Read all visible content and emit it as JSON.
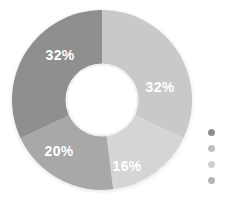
{
  "chart_data": {
    "type": "pie",
    "variant": "donut",
    "title": "",
    "subtitle": "",
    "xlabel": "",
    "ylabel": "",
    "grid": false,
    "legend_position": "right",
    "start_angle_deg": 0,
    "direction": "clockwise",
    "inner_radius_ratio": 0.39,
    "categories": [
      "Segment 1",
      "Segment 2",
      "Segment 3",
      "Segment 4"
    ],
    "values": [
      32,
      16,
      20,
      32
    ],
    "value_unit": "%",
    "data_labels": [
      "32%",
      "16%",
      "20%",
      "32%"
    ],
    "colors": [
      "#c9c9c9",
      "#d5d5d5",
      "#a8a8a8",
      "#8f8f8f"
    ],
    "slices": [
      {
        "label": "32%",
        "value": 32,
        "color": "#c9c9c9",
        "start_deg": 0,
        "end_deg": 115.2,
        "label_x": 160,
        "label_y": 87
      },
      {
        "label": "16%",
        "value": 16,
        "color": "#d5d5d5",
        "start_deg": 115.2,
        "end_deg": 172.8,
        "label_x": 127,
        "label_y": 166
      },
      {
        "label": "20%",
        "value": 20,
        "color": "#a8a8a8",
        "start_deg": 172.8,
        "end_deg": 244.8,
        "label_x": 59,
        "label_y": 151
      },
      {
        "label": "32%",
        "value": 32,
        "color": "#8f8f8f",
        "start_deg": 244.8,
        "end_deg": 360,
        "label_x": 60,
        "label_y": 55
      }
    ]
  },
  "legend": {
    "items": [
      {
        "marker_color": "#8f8f8f",
        "label": ""
      },
      {
        "marker_color": "#c0c0c0",
        "label": ""
      },
      {
        "marker_color": "#cfcfcf",
        "label": ""
      },
      {
        "marker_color": "#b5b5b5",
        "label": ""
      }
    ]
  },
  "theme": {
    "background": "#ffffff",
    "label_color": "#ffffff",
    "legend_text_color": "#9a9a9a",
    "donut_hole_color": "#ffffff",
    "ring_shadow_color": "#f0f0f0"
  }
}
